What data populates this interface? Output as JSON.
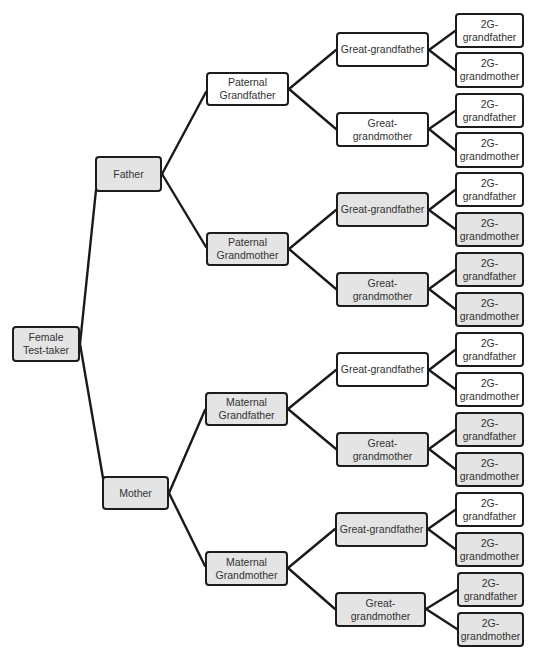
{
  "diagram": {
    "title": "",
    "colors": {
      "shaded_fill": "#e4e4e4",
      "plain_fill": "#ffffff",
      "border": "#1c1c1c",
      "line": "#1a1a1a",
      "text": "#333333"
    },
    "nodes": [
      {
        "id": "self",
        "label": "Female\nTest-taker",
        "x": 12,
        "y": 326,
        "w": 68,
        "h": 36,
        "shaded": true
      },
      {
        "id": "father",
        "label": "Father",
        "x": 95,
        "y": 156,
        "w": 67,
        "h": 36,
        "shaded": true
      },
      {
        "id": "mother",
        "label": "Mother",
        "x": 102,
        "y": 476,
        "w": 67,
        "h": 34,
        "shaded": true
      },
      {
        "id": "pgf",
        "label": "Paternal\nGrandfather",
        "x": 206,
        "y": 72,
        "w": 83,
        "h": 34,
        "shaded": false
      },
      {
        "id": "pgm",
        "label": "Paternal\nGrandmother",
        "x": 206,
        "y": 232,
        "w": 83,
        "h": 34,
        "shaded": true
      },
      {
        "id": "mgf",
        "label": "Maternal\nGrandfather",
        "x": 205,
        "y": 392,
        "w": 83,
        "h": 34,
        "shaded": true
      },
      {
        "id": "mgm",
        "label": "Maternal\nGrandmother",
        "x": 205,
        "y": 551,
        "w": 83,
        "h": 35,
        "shaded": true
      },
      {
        "id": "gg1",
        "label": "Great-grandfather",
        "x": 336,
        "y": 32,
        "w": 93,
        "h": 35,
        "shaded": false
      },
      {
        "id": "gg2",
        "label": "Great-grandmother",
        "x": 336,
        "y": 112,
        "w": 93,
        "h": 35,
        "shaded": false
      },
      {
        "id": "gg3",
        "label": "Great-grandfather",
        "x": 336,
        "y": 192,
        "w": 93,
        "h": 35,
        "shaded": true
      },
      {
        "id": "gg4",
        "label": "Great-grandmother",
        "x": 336,
        "y": 272,
        "w": 93,
        "h": 35,
        "shaded": true
      },
      {
        "id": "gg5",
        "label": "Great-grandfather",
        "x": 336,
        "y": 352,
        "w": 93,
        "h": 35,
        "shaded": false
      },
      {
        "id": "gg6",
        "label": "Great-grandmother",
        "x": 336,
        "y": 432,
        "w": 93,
        "h": 35,
        "shaded": true
      },
      {
        "id": "gg7",
        "label": "Great-grandfather",
        "x": 335,
        "y": 512,
        "w": 93,
        "h": 35,
        "shaded": true
      },
      {
        "id": "gg8",
        "label": "Great-grandmother",
        "x": 335,
        "y": 592,
        "w": 91,
        "h": 35,
        "shaded": true
      },
      {
        "id": "g2_1",
        "label": "2G-\ngrandfather",
        "x": 455,
        "y": 13,
        "w": 69,
        "h": 35,
        "shaded": false
      },
      {
        "id": "g2_2",
        "label": "2G-\ngrandmother",
        "x": 455,
        "y": 52,
        "w": 69,
        "h": 36,
        "shaded": false
      },
      {
        "id": "g2_3",
        "label": "2G-\ngrandfather",
        "x": 455,
        "y": 93,
        "w": 69,
        "h": 35,
        "shaded": false
      },
      {
        "id": "g2_4",
        "label": "2G-\ngrandmother",
        "x": 455,
        "y": 132,
        "w": 69,
        "h": 36,
        "shaded": false
      },
      {
        "id": "g2_5",
        "label": "2G-\ngrandfather",
        "x": 455,
        "y": 172,
        "w": 69,
        "h": 35,
        "shaded": false
      },
      {
        "id": "g2_6",
        "label": "2G-\ngrandmother",
        "x": 455,
        "y": 212,
        "w": 69,
        "h": 35,
        "shaded": true
      },
      {
        "id": "g2_7",
        "label": "2G-\ngrandfather",
        "x": 455,
        "y": 252,
        "w": 69,
        "h": 35,
        "shaded": true
      },
      {
        "id": "g2_8",
        "label": "2G-\ngrandmother",
        "x": 455,
        "y": 292,
        "w": 69,
        "h": 35,
        "shaded": true
      },
      {
        "id": "g2_9",
        "label": "2G-\ngrandfather",
        "x": 455,
        "y": 332,
        "w": 69,
        "h": 35,
        "shaded": false
      },
      {
        "id": "g2_10",
        "label": "2G-\ngrandmother",
        "x": 455,
        "y": 372,
        "w": 69,
        "h": 35,
        "shaded": false
      },
      {
        "id": "g2_11",
        "label": "2G-\ngrandfather",
        "x": 455,
        "y": 412,
        "w": 69,
        "h": 35,
        "shaded": true
      },
      {
        "id": "g2_12",
        "label": "2G-\ngrandmother",
        "x": 455,
        "y": 452,
        "w": 69,
        "h": 35,
        "shaded": true
      },
      {
        "id": "g2_13",
        "label": "2G-\ngrandfather",
        "x": 455,
        "y": 492,
        "w": 69,
        "h": 35,
        "shaded": false
      },
      {
        "id": "g2_14",
        "label": "2G-\ngrandmother",
        "x": 455,
        "y": 532,
        "w": 69,
        "h": 35,
        "shaded": true
      },
      {
        "id": "g2_15",
        "label": "2G-\ngrandfather",
        "x": 457,
        "y": 572,
        "w": 67,
        "h": 35,
        "shaded": true
      },
      {
        "id": "g2_16",
        "label": "2G-\ngrandmother",
        "x": 457,
        "y": 612,
        "w": 67,
        "h": 35,
        "shaded": true
      }
    ],
    "edges": [
      {
        "from": "self",
        "to": "father",
        "x1": 80,
        "y1": 344,
        "x2": 96,
        "y2": 190
      },
      {
        "from": "self",
        "to": "mother",
        "x1": 80,
        "y1": 344,
        "x2": 103,
        "y2": 478
      },
      {
        "from": "father",
        "to": "pgf",
        "x1": 162,
        "y1": 174,
        "x2": 206,
        "y2": 92
      },
      {
        "from": "father",
        "to": "pgm",
        "x1": 162,
        "y1": 174,
        "x2": 206,
        "y2": 247
      },
      {
        "from": "mother",
        "to": "mgf",
        "x1": 169,
        "y1": 493,
        "x2": 205,
        "y2": 410
      },
      {
        "from": "mother",
        "to": "mgm",
        "x1": 169,
        "y1": 493,
        "x2": 205,
        "y2": 566
      },
      {
        "from": "pgf",
        "to": "gg1",
        "x1": 289,
        "y1": 89,
        "x2": 336,
        "y2": 50
      },
      {
        "from": "pgf",
        "to": "gg2",
        "x1": 289,
        "y1": 89,
        "x2": 336,
        "y2": 129
      },
      {
        "from": "pgm",
        "to": "gg3",
        "x1": 289,
        "y1": 249,
        "x2": 336,
        "y2": 210
      },
      {
        "from": "pgm",
        "to": "gg4",
        "x1": 289,
        "y1": 249,
        "x2": 336,
        "y2": 289
      },
      {
        "from": "mgf",
        "to": "gg5",
        "x1": 288,
        "y1": 409,
        "x2": 336,
        "y2": 370
      },
      {
        "from": "mgf",
        "to": "gg6",
        "x1": 288,
        "y1": 409,
        "x2": 336,
        "y2": 449
      },
      {
        "from": "mgm",
        "to": "gg7",
        "x1": 288,
        "y1": 568,
        "x2": 335,
        "y2": 529
      },
      {
        "from": "mgm",
        "to": "gg8",
        "x1": 288,
        "y1": 568,
        "x2": 335,
        "y2": 609
      },
      {
        "from": "gg1",
        "to": "g2_1",
        "x1": 429,
        "y1": 50,
        "x2": 455,
        "y2": 31
      },
      {
        "from": "gg1",
        "to": "g2_2",
        "x1": 429,
        "y1": 50,
        "x2": 455,
        "y2": 70
      },
      {
        "from": "gg2",
        "to": "g2_3",
        "x1": 429,
        "y1": 129,
        "x2": 455,
        "y2": 111
      },
      {
        "from": "gg2",
        "to": "g2_4",
        "x1": 429,
        "y1": 129,
        "x2": 455,
        "y2": 150
      },
      {
        "from": "gg3",
        "to": "g2_5",
        "x1": 429,
        "y1": 210,
        "x2": 455,
        "y2": 190
      },
      {
        "from": "gg3",
        "to": "g2_6",
        "x1": 429,
        "y1": 210,
        "x2": 455,
        "y2": 229
      },
      {
        "from": "gg4",
        "to": "g2_7",
        "x1": 429,
        "y1": 289,
        "x2": 455,
        "y2": 270
      },
      {
        "from": "gg4",
        "to": "g2_8",
        "x1": 429,
        "y1": 289,
        "x2": 455,
        "y2": 309
      },
      {
        "from": "gg5",
        "to": "g2_9",
        "x1": 429,
        "y1": 370,
        "x2": 455,
        "y2": 350
      },
      {
        "from": "gg5",
        "to": "g2_10",
        "x1": 429,
        "y1": 370,
        "x2": 455,
        "y2": 389
      },
      {
        "from": "gg6",
        "to": "g2_11",
        "x1": 429,
        "y1": 449,
        "x2": 455,
        "y2": 430
      },
      {
        "from": "gg6",
        "to": "g2_12",
        "x1": 429,
        "y1": 449,
        "x2": 455,
        "y2": 469
      },
      {
        "from": "gg7",
        "to": "g2_13",
        "x1": 428,
        "y1": 529,
        "x2": 455,
        "y2": 510
      },
      {
        "from": "gg7",
        "to": "g2_14",
        "x1": 428,
        "y1": 529,
        "x2": 455,
        "y2": 549
      },
      {
        "from": "gg8",
        "to": "g2_15",
        "x1": 426,
        "y1": 609,
        "x2": 457,
        "y2": 590
      },
      {
        "from": "gg8",
        "to": "g2_16",
        "x1": 426,
        "y1": 609,
        "x2": 457,
        "y2": 629
      }
    ]
  }
}
